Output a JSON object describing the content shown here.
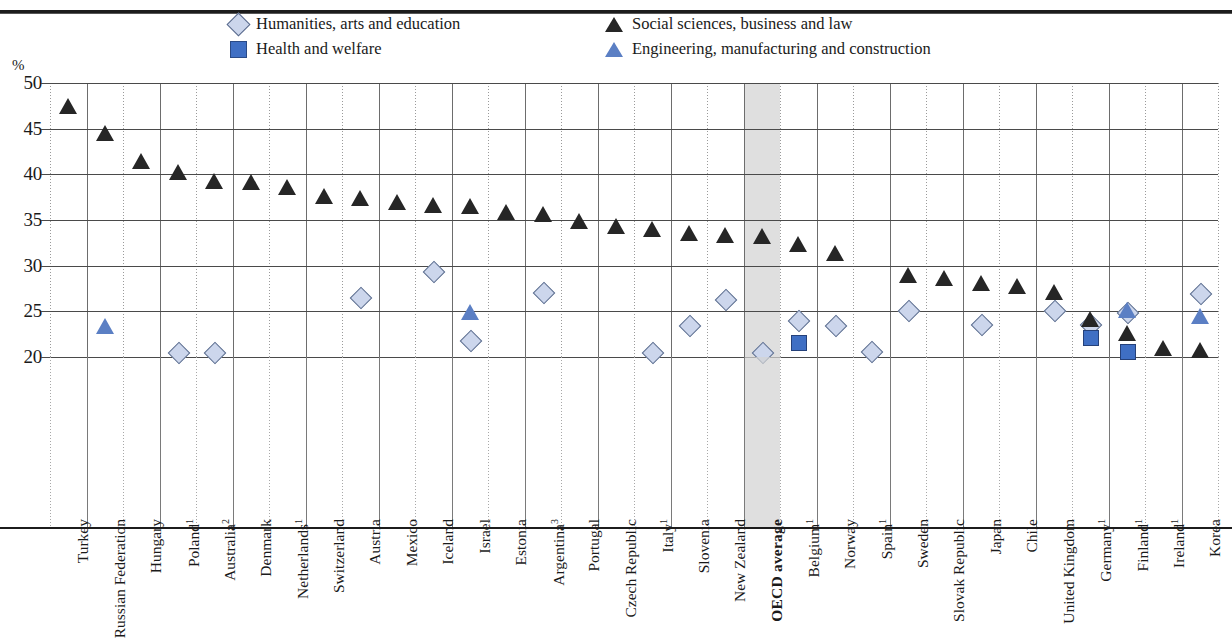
{
  "axis": {
    "y_unit_label": "%",
    "y_ticks": [
      50,
      45,
      40,
      35,
      30,
      25,
      20
    ],
    "y_min": 20,
    "y_max": 50
  },
  "legend": {
    "items": [
      {
        "marker": "diamond-icon",
        "label": "Humanities, arts and education",
        "color": "#ccd6ec"
      },
      {
        "marker": "square-icon",
        "label": "Health and welfare",
        "color": "#3f6fc4"
      },
      {
        "marker": "triangle-dark-icon",
        "label": "Social sciences, business and law",
        "color": "#262626"
      },
      {
        "marker": "triangle-blue-icon",
        "label": "Engineering, manufacturing and construction",
        "color": "#5b7fc4"
      }
    ]
  },
  "highlight": {
    "category": "OECD average",
    "color": "#d2d2d2"
  },
  "chart_data": {
    "type": "scatter",
    "title": "",
    "xlabel": "",
    "ylabel": "%",
    "ylim": [
      20,
      50
    ],
    "grid": true,
    "legend_position": "top",
    "categories": [
      "Turkey",
      "Russian Federation",
      "Hungary",
      "Poland¹",
      "Australia²",
      "Denmark",
      "Netherlands¹",
      "Switzerland",
      "Austria",
      "Mexico",
      "Iceland",
      "Israel",
      "Estonia",
      "Argentina³",
      "Portugal",
      "Czech Republic",
      "Italy¹",
      "Slovenia",
      "New Zealand",
      "OECD average",
      "Belgium¹",
      "Norway",
      "Spain¹",
      "Sweden",
      "Slovak Republic",
      "Japan",
      "Chile",
      "United Kingdom",
      "Germany¹",
      "Finland¹",
      "Ireland¹",
      "Korea"
    ],
    "series": [
      {
        "name": "Social sciences, business and law",
        "marker": "triangle-dark",
        "color": "#262626",
        "values": [
          47.4,
          44.4,
          41.3,
          40.1,
          39.2,
          39.1,
          38.5,
          37.5,
          37.3,
          36.9,
          36.5,
          36.4,
          35.8,
          35.5,
          34.8,
          34.2,
          33.9,
          33.5,
          33.3,
          33.1,
          32.3,
          31.3,
          null,
          28.9,
          28.5,
          28.0,
          27.7,
          27.0,
          null,
          null,
          null,
          null
        ]
      },
      {
        "name": "Humanities, arts and education",
        "marker": "diamond",
        "color": "#ccd6ec",
        "values": [
          null,
          null,
          null,
          20.6,
          20.6,
          null,
          null,
          null,
          26.6,
          null,
          29.4,
          21.9,
          null,
          27.1,
          null,
          null,
          20.6,
          23.5,
          26.3,
          20.6,
          24.0,
          23.5,
          20.7,
          25.2,
          null,
          23.6,
          null,
          25.1,
          23.6,
          24.9,
          null,
          27.0
        ]
      },
      {
        "name": "Engineering, manufacturing and construction",
        "marker": "triangle-blue",
        "color": "#5b7fc4",
        "values": [
          null,
          23.3,
          null,
          null,
          null,
          null,
          null,
          null,
          null,
          null,
          null,
          24.8,
          null,
          null,
          null,
          null,
          null,
          null,
          null,
          null,
          null,
          null,
          null,
          null,
          null,
          null,
          null,
          null,
          null,
          25.0,
          null,
          24.4
        ]
      },
      {
        "name": "Health and welfare",
        "marker": "square",
        "color": "#3f6fc4",
        "values": [
          null,
          null,
          null,
          null,
          null,
          null,
          null,
          null,
          null,
          null,
          null,
          null,
          null,
          null,
          null,
          null,
          null,
          null,
          null,
          null,
          21.6,
          null,
          null,
          null,
          null,
          null,
          null,
          null,
          22.2,
          20.7,
          null,
          null
        ]
      },
      {
        "name": "Social sciences (low values)",
        "marker": "triangle-dark",
        "color": "#262626",
        "values": [
          null,
          null,
          null,
          null,
          null,
          null,
          null,
          null,
          null,
          null,
          null,
          null,
          null,
          null,
          null,
          null,
          null,
          null,
          null,
          null,
          null,
          null,
          null,
          null,
          null,
          null,
          null,
          null,
          24.0,
          22.5,
          20.9,
          20.7
        ]
      }
    ]
  }
}
